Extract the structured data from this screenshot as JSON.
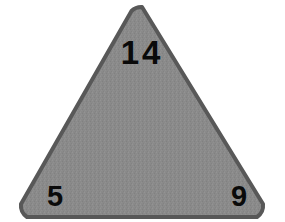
{
  "figure": {
    "shape_name": "triangle",
    "background_color": "#ffffff",
    "fill_color": "#8a8a8a",
    "stroke_color": "#585858",
    "stroke_width": 4,
    "corner_radius": 14,
    "text_color": "#0a0a0a",
    "vertices": {
      "apex": {
        "x": 142,
        "y": 7
      },
      "bottom_left": {
        "x": 13,
        "y": 217
      },
      "bottom_right": {
        "x": 271,
        "y": 217
      }
    },
    "labels": {
      "apex": "14",
      "bottom_left": "5",
      "bottom_right": "9"
    }
  }
}
